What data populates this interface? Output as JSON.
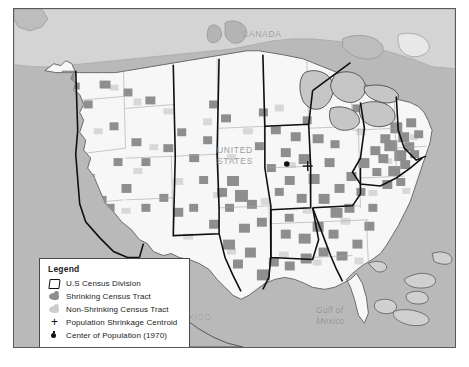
{
  "figure": {
    "type": "thematic-map"
  },
  "geo_labels": {
    "canada": "CANADA",
    "united_states": "UNITED\nSTATES",
    "mexico": "MEXICO",
    "gulf_of_mexico": "Gulf of\nMexico"
  },
  "legend": {
    "title": "Legend",
    "items": [
      {
        "icon": "census-division-outline-icon",
        "label": "U.S Census Division"
      },
      {
        "icon": "shrinking-tract-swatch-icon",
        "label": "Shrinking Census Tract"
      },
      {
        "icon": "non-shrinking-tract-swatch-icon",
        "label": "Non-Shrinking Census Tract"
      },
      {
        "icon": "plus-marker-icon",
        "label": "Population Shrinkage Centroid"
      },
      {
        "icon": "dot-marker-icon",
        "label": "Center of Population (1970)"
      }
    ]
  },
  "colors": {
    "ocean_and_foreign_land": "#b9b9b9",
    "us_land": "#f7f7f7",
    "shrinking_tract": "#8e8e8e",
    "non_shrinking_tract": "#cdcdcd",
    "census_division_border": "#101010",
    "state_border": "#9a9a9a",
    "frame_border": "#5a5a5a",
    "legend_background": "#ffffff",
    "geo_label_text": "#9d9d9d"
  },
  "markers": {
    "population_shrinkage_centroid": {
      "x": 308,
      "y": 165
    },
    "center_of_population_1970": {
      "x": 290,
      "y": 163
    }
  }
}
